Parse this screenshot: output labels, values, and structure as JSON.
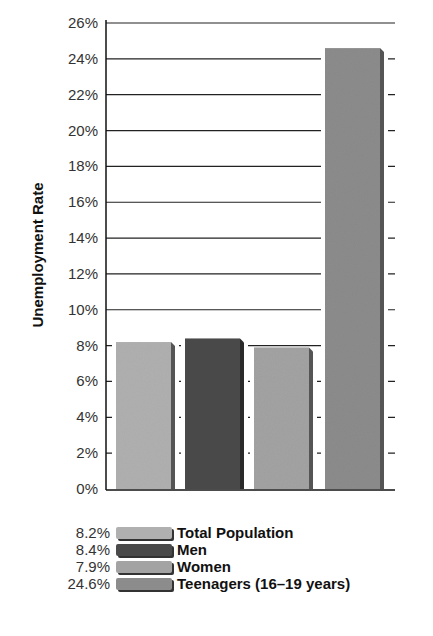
{
  "chart_data": {
    "type": "bar",
    "title": "",
    "xlabel": "",
    "ylabel": "Unemployment Rate",
    "ylim": [
      0,
      26
    ],
    "yticks": [
      "0%",
      "2%",
      "4%",
      "6%",
      "8%",
      "10%",
      "12%",
      "14%",
      "16%",
      "18%",
      "20%",
      "22%",
      "24%",
      "26%"
    ],
    "grid": true,
    "legend_position": "bottom",
    "categories": [
      "Total Population",
      "Men",
      "Women",
      "Teenagers (16–19 years)"
    ],
    "values": [
      8.2,
      8.4,
      7.9,
      24.6
    ],
    "value_labels": [
      "8.2%",
      "8.4%",
      "7.9%",
      "24.6%"
    ],
    "colors": [
      "#b0b0b0",
      "#4a4a4a",
      "#a3a3a3",
      "#8c8c8c"
    ]
  }
}
